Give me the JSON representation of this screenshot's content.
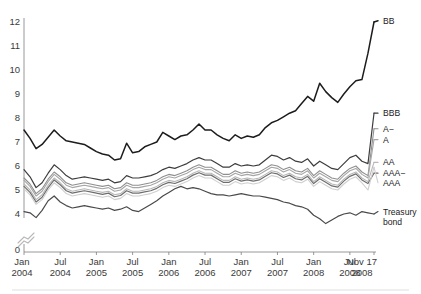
{
  "chart_data": {
    "type": "line",
    "title": "",
    "subtitle": "",
    "xlabel": "",
    "ylabel": "",
    "grid": false,
    "legend_position": "right-inline",
    "axis_break": true,
    "axis_break_between": [
      0,
      4
    ],
    "ylim": [
      4,
      12
    ],
    "y_ticks": [
      "12",
      "11",
      "10",
      "9",
      "8",
      "7",
      "6",
      "5",
      "4",
      "0"
    ],
    "y_tick_values": [
      12,
      11,
      10,
      9,
      8,
      7,
      6,
      5,
      4,
      0
    ],
    "x_tick_labels": [
      {
        "top": "Jan",
        "bottom": "2004"
      },
      {
        "top": "Jul",
        "bottom": "2004"
      },
      {
        "top": "Jan",
        "bottom": "2005"
      },
      {
        "top": "Jul",
        "bottom": "2005"
      },
      {
        "top": "Jan",
        "bottom": "2006"
      },
      {
        "top": "Jul",
        "bottom": "2006"
      },
      {
        "top": "Jan",
        "bottom": "2007"
      },
      {
        "top": "Jul",
        "bottom": "2007"
      },
      {
        "top": "Jan",
        "bottom": "2008"
      },
      {
        "top": "Jul",
        "bottom": "2008"
      },
      {
        "top": "Nov 17",
        "bottom": "2008"
      }
    ],
    "x_tick_index": [
      0,
      6,
      12,
      18,
      24,
      30,
      36,
      42,
      48,
      54,
      58
    ],
    "x_count": 59,
    "series": [
      {
        "name": "BB",
        "label": "BB",
        "color": "#1c1c1c",
        "width": 1.5,
        "label_y": 12.05,
        "values": [
          7.5,
          7.15,
          6.72,
          6.9,
          7.2,
          7.5,
          7.25,
          7.05,
          7.0,
          6.95,
          6.9,
          6.75,
          6.6,
          6.5,
          6.45,
          6.25,
          6.3,
          6.95,
          6.55,
          6.6,
          6.8,
          6.9,
          7.0,
          7.4,
          7.25,
          7.1,
          7.25,
          7.3,
          7.5,
          7.75,
          7.5,
          7.5,
          7.3,
          7.15,
          7.05,
          7.3,
          7.15,
          7.25,
          7.2,
          7.3,
          7.6,
          7.8,
          7.9,
          8.05,
          8.2,
          8.3,
          8.6,
          8.9,
          8.7,
          9.45,
          9.1,
          8.85,
          8.65,
          9.0,
          9.3,
          9.55,
          9.6,
          10.7,
          12.0
        ]
      },
      {
        "name": "BBB",
        "label": "BBB",
        "color": "#3d3d3d",
        "width": 1.2,
        "label_y": 8.2,
        "values": [
          5.85,
          5.55,
          5.1,
          5.3,
          5.7,
          6.05,
          5.85,
          5.6,
          5.45,
          5.5,
          5.55,
          5.5,
          5.45,
          5.4,
          5.45,
          5.3,
          5.35,
          5.6,
          5.5,
          5.5,
          5.55,
          5.6,
          5.7,
          5.85,
          5.95,
          5.9,
          6.0,
          6.1,
          6.25,
          6.35,
          6.25,
          6.25,
          6.1,
          5.95,
          5.95,
          6.1,
          6.0,
          6.05,
          6.0,
          6.05,
          6.25,
          6.45,
          6.4,
          6.25,
          6.35,
          6.2,
          6.15,
          6.3,
          6.0,
          6.2,
          6.05,
          5.9,
          5.85,
          6.1,
          6.35,
          6.45,
          6.2,
          6.1,
          8.2
        ]
      },
      {
        "name": "A−",
        "label": "A−",
        "color": "#8f8f8f",
        "width": 1.1,
        "label_y": 7.55,
        "values": [
          5.5,
          5.25,
          4.85,
          5.05,
          5.45,
          5.75,
          5.55,
          5.3,
          5.2,
          5.25,
          5.3,
          5.25,
          5.2,
          5.15,
          5.2,
          5.05,
          5.1,
          5.3,
          5.2,
          5.2,
          5.25,
          5.3,
          5.4,
          5.55,
          5.65,
          5.6,
          5.7,
          5.8,
          5.95,
          6.05,
          5.95,
          5.95,
          5.8,
          5.65,
          5.65,
          5.8,
          5.7,
          5.75,
          5.7,
          5.75,
          5.9,
          6.05,
          6.0,
          5.85,
          5.95,
          5.8,
          5.75,
          5.9,
          5.6,
          5.8,
          5.65,
          5.5,
          5.45,
          5.7,
          5.9,
          6.0,
          5.75,
          5.6,
          7.55
        ]
      },
      {
        "name": "A",
        "label": "A",
        "color": "#a6a6a6",
        "width": 1.1,
        "label_y": 7.1,
        "values": [
          5.4,
          5.15,
          4.75,
          4.95,
          5.35,
          5.65,
          5.45,
          5.2,
          5.1,
          5.15,
          5.2,
          5.15,
          5.1,
          5.05,
          5.1,
          4.95,
          5.0,
          5.2,
          5.1,
          5.1,
          5.15,
          5.2,
          5.3,
          5.45,
          5.55,
          5.5,
          5.6,
          5.7,
          5.85,
          5.95,
          5.85,
          5.85,
          5.7,
          5.55,
          5.55,
          5.7,
          5.6,
          5.65,
          5.6,
          5.65,
          5.8,
          5.95,
          5.9,
          5.75,
          5.85,
          5.7,
          5.65,
          5.8,
          5.5,
          5.7,
          5.55,
          5.4,
          5.35,
          5.6,
          5.8,
          5.9,
          5.65,
          5.5,
          7.1
        ]
      },
      {
        "name": "AA",
        "label": "AA",
        "color": "#b8b8b8",
        "width": 1.1,
        "label_y": 6.15,
        "values": [
          5.25,
          5.0,
          4.6,
          4.8,
          5.2,
          5.5,
          5.3,
          5.05,
          4.95,
          5.0,
          5.05,
          5.0,
          4.95,
          4.9,
          4.95,
          4.8,
          4.85,
          5.05,
          4.95,
          4.95,
          5.0,
          5.05,
          5.15,
          5.3,
          5.4,
          5.35,
          5.45,
          5.55,
          5.7,
          5.8,
          5.7,
          5.7,
          5.55,
          5.4,
          5.4,
          5.55,
          5.45,
          5.5,
          5.45,
          5.5,
          5.65,
          5.8,
          5.75,
          5.6,
          5.7,
          5.55,
          5.5,
          5.65,
          5.35,
          5.55,
          5.4,
          5.25,
          5.2,
          5.45,
          5.65,
          5.75,
          5.5,
          5.35,
          6.15
        ]
      },
      {
        "name": "AAA−",
        "label": "AAA−",
        "color": "#6e6e6e",
        "width": 1.2,
        "label_y": 5.7,
        "values": [
          5.15,
          4.9,
          4.5,
          4.7,
          5.1,
          5.42,
          5.22,
          4.97,
          4.87,
          4.92,
          4.97,
          4.92,
          4.87,
          4.82,
          4.87,
          4.72,
          4.77,
          4.97,
          4.87,
          4.87,
          4.92,
          4.97,
          5.07,
          5.22,
          5.32,
          5.27,
          5.37,
          5.47,
          5.62,
          5.72,
          5.62,
          5.62,
          5.47,
          5.32,
          5.32,
          5.47,
          5.37,
          5.42,
          5.37,
          5.42,
          5.57,
          5.72,
          5.67,
          5.52,
          5.62,
          5.47,
          5.42,
          5.57,
          5.27,
          5.47,
          5.32,
          5.17,
          5.12,
          5.37,
          5.57,
          5.67,
          5.42,
          5.27,
          5.7
        ]
      },
      {
        "name": "AAA",
        "label": "AAA",
        "color": "#cfcfcf",
        "width": 1.1,
        "label_y": 5.3,
        "values": [
          5.05,
          4.8,
          4.4,
          4.6,
          5.0,
          5.3,
          5.1,
          4.85,
          4.75,
          4.8,
          4.85,
          4.8,
          4.75,
          4.7,
          4.75,
          4.6,
          4.65,
          4.85,
          4.75,
          4.75,
          4.8,
          4.85,
          4.95,
          5.1,
          5.2,
          5.15,
          5.25,
          5.35,
          5.5,
          5.6,
          5.5,
          5.5,
          5.35,
          5.2,
          5.2,
          5.35,
          5.25,
          5.3,
          5.25,
          5.3,
          5.45,
          5.6,
          5.55,
          5.4,
          5.5,
          5.35,
          5.3,
          5.45,
          5.15,
          5.35,
          5.2,
          5.05,
          5.0,
          5.25,
          5.45,
          5.55,
          5.3,
          5.0,
          5.95
        ]
      },
      {
        "name": "Treasury bond",
        "label_line1": "Treasury",
        "label_line2": "bond",
        "color": "#4a4a4a",
        "width": 1.2,
        "label_y": 4.1,
        "values": [
          4.1,
          4.05,
          3.85,
          4.15,
          4.55,
          4.75,
          4.5,
          4.35,
          4.25,
          4.3,
          4.35,
          4.3,
          4.25,
          4.2,
          4.25,
          4.15,
          4.2,
          4.3,
          4.15,
          4.1,
          4.25,
          4.4,
          4.55,
          4.75,
          4.9,
          5.05,
          5.15,
          5.05,
          5.1,
          5.05,
          4.95,
          4.85,
          4.8,
          4.8,
          4.75,
          4.8,
          4.85,
          4.8,
          4.75,
          4.75,
          4.7,
          4.65,
          4.6,
          4.5,
          4.45,
          4.35,
          4.3,
          4.2,
          3.95,
          3.8,
          3.6,
          3.75,
          3.9,
          4.0,
          4.05,
          3.95,
          4.1,
          4.05,
          4.0
        ]
      }
    ]
  }
}
